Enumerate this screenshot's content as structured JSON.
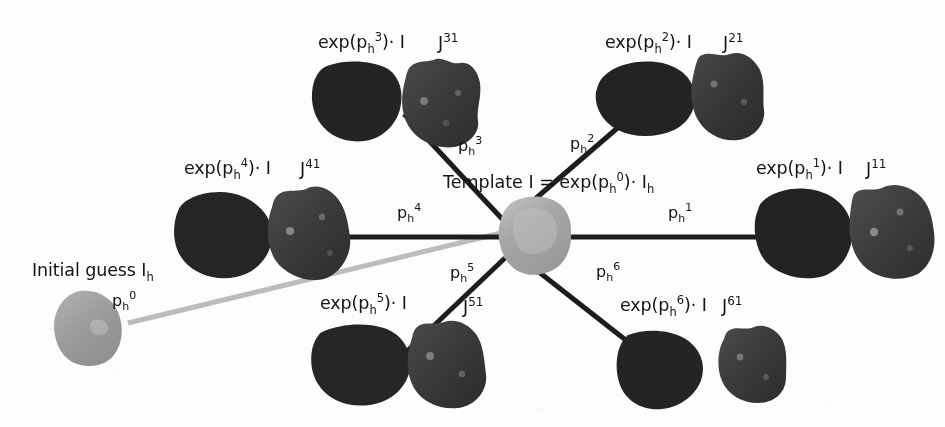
{
  "figure": {
    "name": "template-registration-star-diagram",
    "background_color": "#fdfdfd",
    "width": 945,
    "height": 427
  },
  "colors": {
    "edge_dark": "#1d1d1d",
    "edge_light": "#bcbcbc",
    "shape_dark": "#262626",
    "shape_mid": "#3c3c3c",
    "shape_light": "#a9a9a9",
    "text": "#141414"
  },
  "center": {
    "template_label": {
      "prefix": "Template I = exp(p",
      "sub": "h",
      "sup": "0",
      "mid": ")· I",
      "tail_sub": "h"
    }
  },
  "initial_guess": {
    "label": {
      "text": "Initial guess I",
      "sub": "h"
    },
    "edge_label": {
      "base": "p",
      "sub": "h",
      "sup": "0"
    }
  },
  "branches": [
    {
      "id": "branch-1",
      "position": "right",
      "exp_label": {
        "prefix": "exp(p",
        "sub": "h",
        "sup": "1",
        "suffix": ")· I"
      },
      "j_label": {
        "base": "J",
        "sup": "11"
      },
      "edge_label": {
        "base": "p",
        "sub": "h",
        "sup": "1"
      }
    },
    {
      "id": "branch-2",
      "position": "top-right",
      "exp_label": {
        "prefix": "exp(p",
        "sub": "h",
        "sup": "2",
        "suffix": ")· I"
      },
      "j_label": {
        "base": "J",
        "sup": "21"
      },
      "edge_label": {
        "base": "p",
        "sub": "h",
        "sup": "2"
      }
    },
    {
      "id": "branch-3",
      "position": "top-left",
      "exp_label": {
        "prefix": "exp(p",
        "sub": "h",
        "sup": "3",
        "suffix": ")· I"
      },
      "j_label": {
        "base": "J",
        "sup": "31"
      },
      "edge_label": {
        "base": "p",
        "sub": "h",
        "sup": "3"
      }
    },
    {
      "id": "branch-4",
      "position": "left",
      "exp_label": {
        "prefix": "exp(p",
        "sub": "h",
        "sup": "4",
        "suffix": ")· I"
      },
      "j_label": {
        "base": "J",
        "sup": "41"
      },
      "edge_label": {
        "base": "p",
        "sub": "h",
        "sup": "4"
      }
    },
    {
      "id": "branch-5",
      "position": "bottom-left",
      "exp_label": {
        "prefix": "exp(p",
        "sub": "h",
        "sup": "5",
        "suffix": ")· I"
      },
      "j_label": {
        "base": "J",
        "sup": "51"
      },
      "edge_label": {
        "base": "p",
        "sub": "h",
        "sup": "5"
      }
    },
    {
      "id": "branch-6",
      "position": "bottom-right",
      "exp_label": {
        "prefix": "exp(p",
        "sub": "h",
        "sup": "6",
        "suffix": ")· I"
      },
      "j_label": {
        "base": "J",
        "sup": "61"
      },
      "edge_label": {
        "base": "p",
        "sub": "h",
        "sup": "6"
      }
    }
  ]
}
